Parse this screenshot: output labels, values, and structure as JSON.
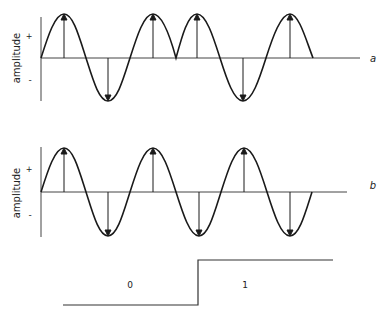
{
  "figure": {
    "panel_a": {
      "label": "a",
      "ylabel": "amplitude",
      "plus": "+",
      "minus": "-",
      "description": "Sine carrier with phase reversal at midpoint (cusp)",
      "peaks_x": [
        64,
        153,
        197,
        290
      ],
      "troughs_x": [
        108,
        243
      ]
    },
    "panel_b": {
      "label": "b",
      "ylabel": "amplitude",
      "plus": "+",
      "minus": "-",
      "description": "Continuous sine carrier",
      "peaks_x": [
        64,
        153,
        244
      ],
      "troughs_x": [
        108,
        199,
        290
      ]
    },
    "step": {
      "low_label": "0",
      "high_label": "1"
    },
    "colors": {
      "line": "#1a1a1a",
      "axis": "#444444",
      "background": "#ffffff"
    }
  }
}
